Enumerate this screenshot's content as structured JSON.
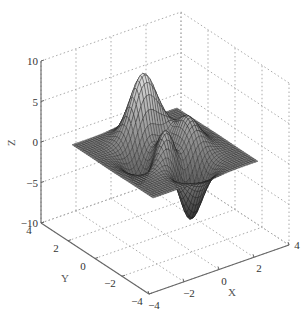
{
  "chart_data": {
    "type": "surface3d",
    "title": "",
    "function": "peaks",
    "xlabel": "X",
    "ylabel": "Y",
    "zlabel": "Z",
    "xlim": [
      -4,
      4
    ],
    "ylim": [
      -4,
      4
    ],
    "zlim": [
      -10,
      10
    ],
    "xticks": [
      -4,
      -2,
      0,
      2,
      4
    ],
    "yticks": [
      -4,
      -2,
      0,
      2,
      4
    ],
    "zticks": [
      -10,
      -5,
      0,
      5,
      10
    ],
    "xtick_labels": [
      "−4",
      "−2",
      "0",
      "2",
      "4"
    ],
    "ytick_labels": [
      "−4",
      "−2",
      "0",
      "2",
      "4"
    ],
    "ztick_labels": [
      "−10",
      "−5",
      "0",
      "5",
      "10"
    ],
    "grid": true,
    "grid_style": "dotted",
    "colormap": "gray",
    "grid_resolution": 41,
    "features": [
      {
        "type": "peak",
        "x": -0.1,
        "y": 1.6,
        "z": 8.1
      },
      {
        "type": "peak",
        "x": 1.3,
        "y": 0.0,
        "z": 3.8
      },
      {
        "type": "trough",
        "x": 0.2,
        "y": -1.6,
        "z": -6.5
      },
      {
        "type": "trough",
        "x": -1.4,
        "y": 0.2,
        "z": -3.0
      }
    ],
    "legend": null
  },
  "axis": {
    "x_label": "X",
    "y_label": "Y",
    "z_label": "Z"
  }
}
